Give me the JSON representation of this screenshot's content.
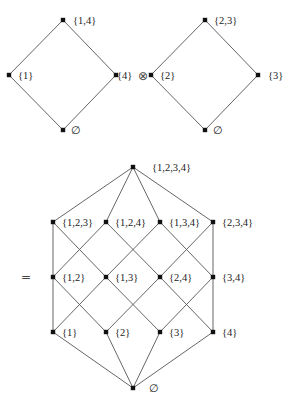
{
  "diagrams": {
    "left_lattice": {
      "nodes": [
        {
          "id": "L0",
          "label": "∅",
          "x": 63,
          "y": 130,
          "lx": 71,
          "ly": 134
        },
        {
          "id": "L1",
          "label": "{1}",
          "x": 9,
          "y": 75,
          "lx": 18,
          "ly": 79
        },
        {
          "id": "L4",
          "label": "{4}",
          "x": 116,
          "y": 75,
          "lx": 117,
          "ly": 79
        },
        {
          "id": "L14",
          "label": "{1,4}",
          "x": 63,
          "y": 20,
          "lx": 73,
          "ly": 24
        }
      ],
      "edges": [
        [
          "L0",
          "L1"
        ],
        [
          "L0",
          "L4"
        ],
        [
          "L1",
          "L14"
        ],
        [
          "L4",
          "L14"
        ]
      ]
    },
    "operator": {
      "symbol": "⊗",
      "x": 138,
      "y": 80
    },
    "right_lattice": {
      "nodes": [
        {
          "id": "R0",
          "label": "∅",
          "x": 205,
          "y": 130,
          "lx": 213,
          "ly": 134
        },
        {
          "id": "R2",
          "label": "{2}",
          "x": 151,
          "y": 75,
          "lx": 160,
          "ly": 79
        },
        {
          "id": "R3",
          "label": "{3}",
          "x": 258,
          "y": 75,
          "lx": 268,
          "ly": 79
        },
        {
          "id": "R23",
          "label": "{2,3}",
          "x": 205,
          "y": 20,
          "lx": 214,
          "ly": 24
        }
      ],
      "edges": [
        [
          "R0",
          "R2"
        ],
        [
          "R0",
          "R3"
        ],
        [
          "R2",
          "R23"
        ],
        [
          "R3",
          "R23"
        ]
      ]
    },
    "equals": {
      "symbol": "=",
      "x": 21,
      "y": 281
    },
    "product_lattice": {
      "nodes": [
        {
          "id": "P1234",
          "label": "{1,2,3,4}",
          "x": 133,
          "y": 167,
          "lx": 152,
          "ly": 171
        },
        {
          "id": "P123",
          "label": "{1,2,3}",
          "x": 53,
          "y": 222,
          "lx": 62,
          "ly": 226
        },
        {
          "id": "P124",
          "label": "{1,2,4}",
          "x": 106,
          "y": 222,
          "lx": 115,
          "ly": 226
        },
        {
          "id": "P134",
          "label": "{1,3,4}",
          "x": 160,
          "y": 222,
          "lx": 169,
          "ly": 226
        },
        {
          "id": "P234",
          "label": "{2,3,4}",
          "x": 213,
          "y": 222,
          "lx": 222,
          "ly": 226
        },
        {
          "id": "P12",
          "label": "{1,2}",
          "x": 53,
          "y": 277,
          "lx": 62,
          "ly": 281
        },
        {
          "id": "P13",
          "label": "{1,3}",
          "x": 106,
          "y": 277,
          "lx": 115,
          "ly": 281
        },
        {
          "id": "P24",
          "label": "{2,4}",
          "x": 160,
          "y": 277,
          "lx": 169,
          "ly": 281
        },
        {
          "id": "P34",
          "label": "{3,4}",
          "x": 213,
          "y": 277,
          "lx": 222,
          "ly": 281
        },
        {
          "id": "P1",
          "label": "{1}",
          "x": 53,
          "y": 332,
          "lx": 62,
          "ly": 336
        },
        {
          "id": "P2",
          "label": "{2}",
          "x": 106,
          "y": 332,
          "lx": 115,
          "ly": 336
        },
        {
          "id": "P3",
          "label": "{3}",
          "x": 160,
          "y": 332,
          "lx": 169,
          "ly": 336
        },
        {
          "id": "P4",
          "label": "{4}",
          "x": 213,
          "y": 332,
          "lx": 222,
          "ly": 336
        },
        {
          "id": "P0",
          "label": "∅",
          "x": 133,
          "y": 388,
          "lx": 149,
          "ly": 392
        }
      ],
      "edges": [
        [
          "P1234",
          "P123"
        ],
        [
          "P1234",
          "P124"
        ],
        [
          "P1234",
          "P134"
        ],
        [
          "P1234",
          "P234"
        ],
        [
          "P123",
          "P12"
        ],
        [
          "P123",
          "P13"
        ],
        [
          "P124",
          "P12"
        ],
        [
          "P124",
          "P24"
        ],
        [
          "P134",
          "P13"
        ],
        [
          "P134",
          "P34"
        ],
        [
          "P234",
          "P24"
        ],
        [
          "P234",
          "P34"
        ],
        [
          "P12",
          "P1"
        ],
        [
          "P12",
          "P2"
        ],
        [
          "P13",
          "P1"
        ],
        [
          "P13",
          "P3"
        ],
        [
          "P24",
          "P2"
        ],
        [
          "P24",
          "P4"
        ],
        [
          "P34",
          "P3"
        ],
        [
          "P34",
          "P4"
        ],
        [
          "P1",
          "P0"
        ],
        [
          "P2",
          "P0"
        ],
        [
          "P3",
          "P0"
        ],
        [
          "P4",
          "P0"
        ]
      ]
    }
  }
}
